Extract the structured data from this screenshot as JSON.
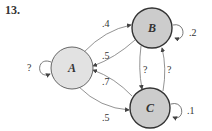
{
  "problem_number": "13.",
  "colors": {
    "node_a_fill": "#e2e2e2",
    "node_bc_fill": "#cccccc",
    "stroke": "#555555",
    "edge": "#777777"
  },
  "nodes": [
    {
      "id": "A",
      "label": "A",
      "self_loop": "?"
    },
    {
      "id": "B",
      "label": "B",
      "self_loop": ".2"
    },
    {
      "id": "C",
      "label": "C",
      "self_loop": ".1"
    }
  ],
  "edges": [
    {
      "from": "A",
      "to": "B",
      "label": ".4"
    },
    {
      "from": "B",
      "to": "A",
      "label": ".5"
    },
    {
      "from": "C",
      "to": "A",
      "label": ".7"
    },
    {
      "from": "A",
      "to": "C",
      "label": ".5"
    },
    {
      "from": "B",
      "to": "C",
      "label": "?"
    },
    {
      "from": "C",
      "to": "B",
      "label": "?"
    }
  ]
}
